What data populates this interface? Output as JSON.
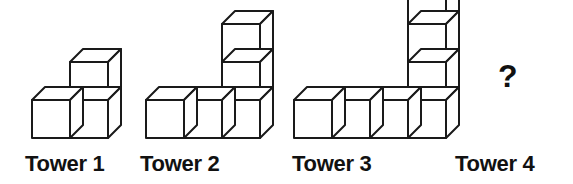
{
  "figure": {
    "title": "",
    "type": "cube-tower-sequence-puzzle",
    "background_color": "#ffffff",
    "line_color": "#1a1a1a",
    "face_color": "#ffffff",
    "cube_size": 38,
    "cube_depth_x": 13,
    "cube_depth_y": 13,
    "towers": [
      {
        "id": "tower-1",
        "label": "Tower 1",
        "base_row_cubes": 1,
        "column_cubes": 2,
        "total_cubes": 3,
        "origin_x": 32,
        "baseline_y": 138,
        "label_x": 25,
        "label_y": 152
      },
      {
        "id": "tower-2",
        "label": "Tower 2",
        "base_row_cubes": 2,
        "column_cubes": 3,
        "total_cubes": 5,
        "origin_x": 146,
        "baseline_y": 138,
        "label_x": 140,
        "label_y": 152
      },
      {
        "id": "tower-3",
        "label": "Tower 3",
        "base_row_cubes": 3,
        "column_cubes": 4,
        "total_cubes": 7,
        "origin_x": 294,
        "baseline_y": 138,
        "label_x": 292,
        "label_y": 152
      },
      {
        "id": "tower-4",
        "label": "Tower 4",
        "base_row_cubes": null,
        "column_cubes": null,
        "total_cubes": null,
        "unknown_marker": "?",
        "marker_x": 498,
        "marker_y": 60,
        "label_x": 455,
        "label_y": 152
      }
    ]
  },
  "chart_data": {
    "type": "diagram",
    "categories": [
      "Tower 1",
      "Tower 2",
      "Tower 3",
      "Tower 4"
    ],
    "values": [
      3,
      5,
      7,
      null
    ],
    "series": [
      {
        "name": "base row cubes",
        "values": [
          1,
          2,
          3,
          null
        ]
      },
      {
        "name": "column cubes",
        "values": [
          2,
          3,
          4,
          null
        ]
      },
      {
        "name": "total cubes",
        "values": [
          3,
          5,
          7,
          null
        ]
      }
    ],
    "annotations": [
      "?"
    ],
    "xlabel": "",
    "ylabel": ""
  }
}
